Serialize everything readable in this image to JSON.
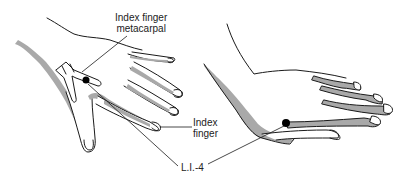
{
  "figure": {
    "type": "anatomical-diagram",
    "colors": {
      "outline": "#1a1a1a",
      "shading": "#a9a9a9",
      "point_marker": "#000000",
      "background": "#ffffff",
      "bone": "#ffffff"
    }
  },
  "labels": {
    "metacarpal": {
      "line1": "Index finger",
      "line2": "metacarpal"
    },
    "index_finger": {
      "line1": "Index",
      "line2": "finger"
    },
    "acupoint": {
      "text": "L.I.-4"
    }
  },
  "views": [
    {
      "name": "dorsal-view-left",
      "description": "back of hand with index finger metacarpal bone shown"
    },
    {
      "name": "side-view-right",
      "description": "hand viewed from thumb side"
    }
  ]
}
